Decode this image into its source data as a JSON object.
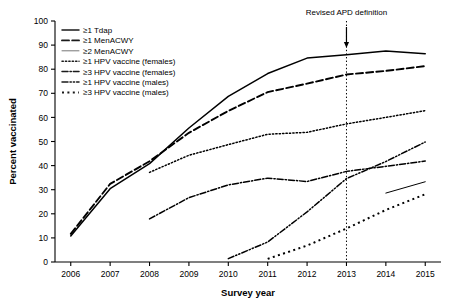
{
  "chart_data": {
    "type": "line",
    "title": "",
    "xlabel": "Survey year",
    "ylabel": "Percent vaccinated",
    "x": [
      2006,
      2007,
      2008,
      2009,
      2010,
      2011,
      2012,
      2013,
      2014,
      2015
    ],
    "xlim": [
      2005.6,
      2015.4
    ],
    "ylim": [
      0,
      100
    ],
    "yticks": [
      0,
      10,
      20,
      30,
      40,
      50,
      60,
      70,
      80,
      90,
      100
    ],
    "xticks": [
      "2006",
      "2007",
      "2008",
      "2009",
      "2010",
      "2011",
      "2012",
      "2013",
      "2014",
      "2015"
    ],
    "grid": false,
    "legend_position": "upper-left",
    "annotations": [
      {
        "text": "Revised APD definition",
        "x": 2013,
        "y": 100,
        "marker": "vertical-dotted-line-with-down-arrow"
      }
    ],
    "series": [
      {
        "name": "≥1 Tdap",
        "style": "solid",
        "x": [
          2006,
          2007,
          2008,
          2009,
          2010,
          2011,
          2012,
          2013,
          2014,
          2015
        ],
        "values": [
          10.8,
          30.4,
          40.8,
          55.6,
          68.7,
          78.2,
          84.6,
          86.0,
          87.6,
          86.4
        ]
      },
      {
        "name": "≥1 MenACWY",
        "style": "dashed",
        "x": [
          2006,
          2007,
          2008,
          2009,
          2010,
          2011,
          2012,
          2013,
          2014,
          2015
        ],
        "values": [
          11.7,
          32.4,
          41.8,
          53.6,
          62.7,
          70.5,
          74.0,
          77.8,
          79.3,
          81.3
        ]
      },
      {
        "name": "≥2 MenACWY",
        "style": "thin-solid",
        "x": [
          2014,
          2015
        ],
        "values": [
          28.6,
          33.3
        ]
      },
      {
        "name": "≥1 HPV vaccine (females)",
        "style": "dotted",
        "x": [
          2008,
          2009,
          2010,
          2011,
          2012,
          2013,
          2014,
          2015
        ],
        "values": [
          37.2,
          44.3,
          48.7,
          53.0,
          53.8,
          57.3,
          60.0,
          62.8
        ]
      },
      {
        "name": "≥3 HPV vaccine (females)",
        "style": "dash-dot",
        "x": [
          2008,
          2009,
          2010,
          2011,
          2012,
          2013,
          2014,
          2015
        ],
        "values": [
          17.9,
          26.7,
          32.0,
          34.8,
          33.4,
          37.6,
          39.7,
          41.9
        ]
      },
      {
        "name": "≥1 HPV vaccine (males)",
        "style": "dash-dot-dot",
        "x": [
          2010,
          2011,
          2012,
          2013,
          2014,
          2015
        ],
        "values": [
          1.4,
          8.3,
          20.8,
          34.6,
          41.7,
          49.8
        ]
      },
      {
        "name": "≥3 HPV vaccine (males)",
        "style": "square-dot",
        "x": [
          2011,
          2012,
          2013,
          2014,
          2015
        ],
        "values": [
          1.3,
          6.8,
          13.9,
          21.6,
          28.1
        ]
      }
    ]
  },
  "legend": {
    "items": [
      {
        "label": "≥1 Tdap",
        "style": "solid"
      },
      {
        "label": "≥1 MenACWY",
        "style": "dashed"
      },
      {
        "label": "≥2 MenACWY",
        "style": "thin-solid"
      },
      {
        "label": "≥1 HPV vaccine (females)",
        "style": "dotted"
      },
      {
        "label": "≥3 HPV vaccine (females)",
        "style": "dash-dot"
      },
      {
        "label": "≥1 HPV vaccine (males)",
        "style": "dash-dot-dot"
      },
      {
        "label": "≥3 HPV vaccine (males)",
        "style": "square-dot"
      }
    ]
  }
}
